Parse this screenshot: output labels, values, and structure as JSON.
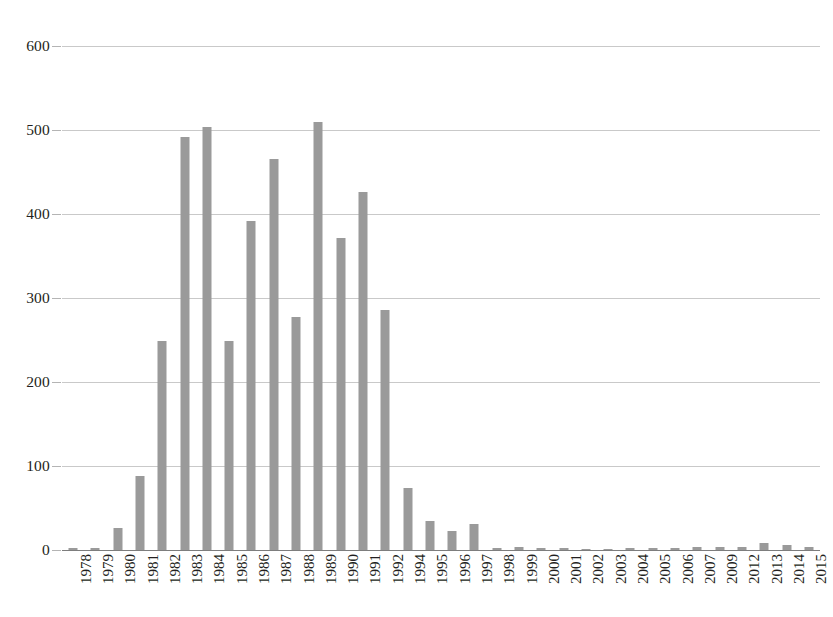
{
  "chart_data": {
    "type": "bar",
    "title": "",
    "subtitle": "",
    "xlabel": "",
    "ylabel": "",
    "ylim": [
      0,
      600
    ],
    "yticks": [
      0,
      100,
      200,
      300,
      400,
      500,
      600
    ],
    "ytick_labels": [
      "0",
      "100",
      "200",
      "300",
      "400",
      "500",
      "600"
    ],
    "grid": true,
    "legend": false,
    "legend_position": "none",
    "bar_color": "#9a9a9a",
    "grid_color": "#c9c9c9",
    "axis_color": "#7d7d7d",
    "text_color": "#231f20",
    "xlabel_rotation": -90,
    "categories": [
      "1978",
      "1979",
      "1980",
      "1981",
      "1982",
      "1983",
      "1984",
      "1985",
      "1986",
      "1987",
      "1988",
      "1989",
      "1990",
      "1991",
      "1992",
      "1994",
      "1995",
      "1996",
      "1997",
      "1998",
      "1999",
      "2000",
      "2001",
      "2002",
      "2003",
      "2004",
      "2005",
      "2006",
      "2007",
      "2009",
      "2012",
      "2013",
      "2014",
      "2015"
    ],
    "values": [
      2,
      2,
      26,
      88,
      249,
      492,
      503,
      249,
      392,
      466,
      277,
      510,
      371,
      426,
      286,
      74,
      35,
      23,
      31,
      2,
      3,
      2,
      2,
      1,
      1,
      2,
      2,
      2,
      3,
      4,
      3,
      8,
      6,
      4
    ]
  }
}
